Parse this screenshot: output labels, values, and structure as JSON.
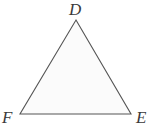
{
  "figure": {
    "kind": "geometry-diagram",
    "shape_name": "triangle",
    "background_color": "#ffffff",
    "canvas": {
      "width": 153,
      "height": 130
    }
  },
  "triangle": {
    "fill_color": "#fbfbfb",
    "stroke_color": "#555555",
    "stroke_width": 1.1,
    "points": "76,20 131,114 20,114",
    "vertices": [
      {
        "id": "D",
        "label": "D",
        "x": 76,
        "y": 20,
        "position": "apex-top"
      },
      {
        "id": "E",
        "label": "E",
        "x": 131,
        "y": 114,
        "position": "bottom-right"
      },
      {
        "id": "F",
        "label": "F",
        "x": 20,
        "y": 114,
        "position": "bottom-left"
      }
    ]
  },
  "labels": {
    "apex": "D",
    "bottom_left": "F",
    "bottom_right": "E",
    "color": "#3a3a3a",
    "style": "italic-serif"
  }
}
